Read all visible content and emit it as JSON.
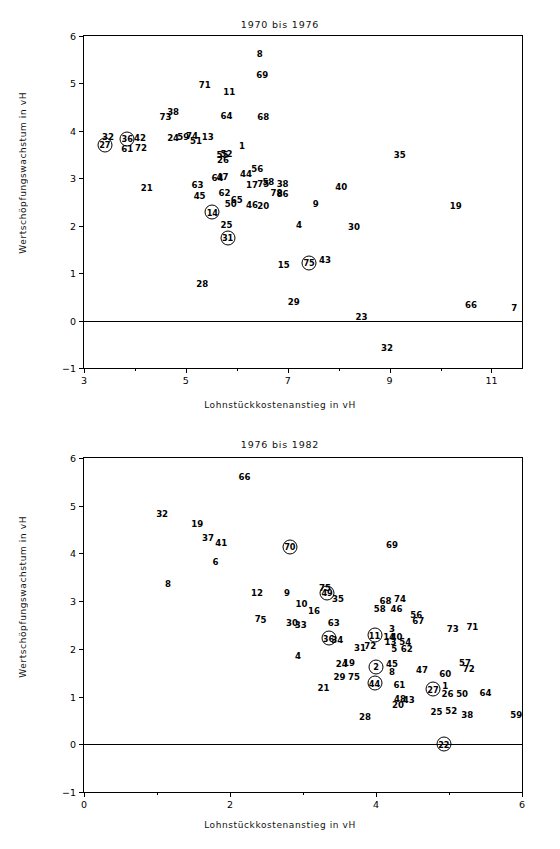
{
  "chart_data": [
    {
      "type": "scatter",
      "title": "1970 bis 1976",
      "xlabel": "Lohnstückkostenanstieg in vH",
      "ylabel": "Wertschöpfungswachstum in vH",
      "xlim": [
        3,
        11.6
      ],
      "ylim": [
        -1,
        6
      ],
      "xticks": [
        3,
        5,
        7,
        9,
        11
      ],
      "xticks_minor": [
        4,
        6,
        8,
        10
      ],
      "yticks": [
        -1,
        0,
        1,
        2,
        3,
        4,
        5,
        6
      ],
      "grid": false,
      "legend": "none",
      "zero_line": 0,
      "note": "Points are drawn as numeric sector labels; circled labels mark highlighted sectors.",
      "points": [
        {
          "label": "8",
          "x": 6.45,
          "y": 5.62,
          "circled": false
        },
        {
          "label": "69",
          "x": 6.5,
          "y": 5.18,
          "circled": false
        },
        {
          "label": "71",
          "x": 5.37,
          "y": 4.97,
          "circled": false
        },
        {
          "label": "11",
          "x": 5.85,
          "y": 4.82,
          "circled": false
        },
        {
          "label": "38",
          "x": 4.75,
          "y": 4.4,
          "circled": false
        },
        {
          "label": "73",
          "x": 4.6,
          "y": 4.3,
          "circled": false
        },
        {
          "label": "64",
          "x": 5.8,
          "y": 4.32,
          "circled": false
        },
        {
          "label": "68",
          "x": 6.52,
          "y": 4.3,
          "circled": false
        },
        {
          "label": "32",
          "x": 3.47,
          "y": 3.88,
          "circled": false
        },
        {
          "label": "27",
          "x": 3.41,
          "y": 3.7,
          "circled": true
        },
        {
          "label": "36",
          "x": 3.85,
          "y": 3.83,
          "circled": true
        },
        {
          "label": "61",
          "x": 3.85,
          "y": 3.62,
          "circled": false
        },
        {
          "label": "42",
          "x": 4.1,
          "y": 3.85,
          "circled": false
        },
        {
          "label": "72",
          "x": 4.12,
          "y": 3.63,
          "circled": false
        },
        {
          "label": "24",
          "x": 4.75,
          "y": 3.84,
          "circled": false
        },
        {
          "label": "59",
          "x": 4.95,
          "y": 3.87,
          "circled": false
        },
        {
          "label": "74",
          "x": 5.12,
          "y": 3.9,
          "circled": false
        },
        {
          "label": "51",
          "x": 5.2,
          "y": 3.78,
          "circled": false
        },
        {
          "label": "13",
          "x": 5.43,
          "y": 3.88,
          "circled": false
        },
        {
          "label": "1",
          "x": 6.1,
          "y": 3.68,
          "circled": false
        },
        {
          "label": "35",
          "x": 9.2,
          "y": 3.5,
          "circled": false
        },
        {
          "label": "52",
          "x": 5.8,
          "y": 3.52,
          "circled": false
        },
        {
          "label": "55",
          "x": 5.72,
          "y": 3.5,
          "circled": false
        },
        {
          "label": "26",
          "x": 5.73,
          "y": 3.38,
          "circled": false
        },
        {
          "label": "56",
          "x": 6.4,
          "y": 3.2,
          "circled": false
        },
        {
          "label": "44",
          "x": 6.18,
          "y": 3.1,
          "circled": false
        },
        {
          "label": "47",
          "x": 5.72,
          "y": 3.02,
          "circled": false
        },
        {
          "label": "64b",
          "x": 5.62,
          "y": 3.0,
          "circled": false
        },
        {
          "label": "63",
          "x": 5.23,
          "y": 2.86,
          "circled": false
        },
        {
          "label": "58",
          "x": 6.62,
          "y": 2.92,
          "circled": false
        },
        {
          "label": "38b",
          "x": 6.9,
          "y": 2.88,
          "circled": false
        },
        {
          "label": "17",
          "x": 6.3,
          "y": 2.85,
          "circled": false
        },
        {
          "label": "75",
          "x": 6.52,
          "y": 2.88,
          "circled": false
        },
        {
          "label": "21",
          "x": 4.23,
          "y": 2.8,
          "circled": false
        },
        {
          "label": "40",
          "x": 8.05,
          "y": 2.82,
          "circled": false
        },
        {
          "label": "78",
          "x": 6.78,
          "y": 2.68,
          "circled": false
        },
        {
          "label": "86",
          "x": 6.9,
          "y": 2.67,
          "circled": false
        },
        {
          "label": "45",
          "x": 5.27,
          "y": 2.62,
          "circled": false
        },
        {
          "label": "62",
          "x": 5.76,
          "y": 2.7,
          "circled": false
        },
        {
          "label": "65",
          "x": 6.0,
          "y": 2.55,
          "circled": false
        },
        {
          "label": "50",
          "x": 5.88,
          "y": 2.45,
          "circled": false
        },
        {
          "label": "46",
          "x": 6.3,
          "y": 2.44,
          "circled": false
        },
        {
          "label": "20",
          "x": 6.52,
          "y": 2.42,
          "circled": false
        },
        {
          "label": "9",
          "x": 7.55,
          "y": 2.45,
          "circled": false
        },
        {
          "label": "19",
          "x": 10.3,
          "y": 2.42,
          "circled": false
        },
        {
          "label": "14",
          "x": 5.52,
          "y": 2.28,
          "circled": true
        },
        {
          "label": "25",
          "x": 5.8,
          "y": 2.02,
          "circled": false
        },
        {
          "label": "4",
          "x": 7.22,
          "y": 2.02,
          "circled": false
        },
        {
          "label": "30",
          "x": 8.3,
          "y": 1.98,
          "circled": false
        },
        {
          "label": "31",
          "x": 5.82,
          "y": 1.75,
          "circled": true
        },
        {
          "label": "75b",
          "x": 7.42,
          "y": 1.22,
          "circled": true
        },
        {
          "label": "43",
          "x": 7.73,
          "y": 1.28,
          "circled": false
        },
        {
          "label": "15",
          "x": 6.92,
          "y": 1.18,
          "circled": false
        },
        {
          "label": "28",
          "x": 5.32,
          "y": 0.78,
          "circled": false
        },
        {
          "label": "29",
          "x": 7.12,
          "y": 0.4,
          "circled": false
        },
        {
          "label": "66",
          "x": 10.6,
          "y": 0.32,
          "circled": false
        },
        {
          "label": "7",
          "x": 11.45,
          "y": 0.26,
          "circled": false
        },
        {
          "label": "23",
          "x": 8.45,
          "y": 0.07,
          "circled": false
        },
        {
          "label": "32b",
          "x": 8.95,
          "y": -0.58,
          "circled": false
        }
      ]
    },
    {
      "type": "scatter",
      "title": "1976 bis 1982",
      "xlabel": "Lohnstückkostenanstieg in vH",
      "ylabel": "Wertschöpfungswachstum in vH",
      "xlim": [
        0,
        6
      ],
      "ylim": [
        -1,
        6
      ],
      "xticks": [
        0,
        2,
        4,
        6
      ],
      "xticks_minor": [
        1,
        3,
        5
      ],
      "yticks": [
        -1,
        0,
        1,
        2,
        3,
        4,
        5,
        6
      ],
      "grid": false,
      "legend": "none",
      "zero_line": 0,
      "points": [
        {
          "label": "66",
          "x": 2.2,
          "y": 5.6,
          "circled": false
        },
        {
          "label": "32",
          "x": 1.07,
          "y": 4.82,
          "circled": false
        },
        {
          "label": "19",
          "x": 1.55,
          "y": 4.62,
          "circled": false
        },
        {
          "label": "37",
          "x": 1.7,
          "y": 4.32,
          "circled": false
        },
        {
          "label": "41",
          "x": 1.88,
          "y": 4.22,
          "circled": false
        },
        {
          "label": "70",
          "x": 2.82,
          "y": 4.14,
          "circled": true
        },
        {
          "label": "69",
          "x": 4.22,
          "y": 4.18,
          "circled": false
        },
        {
          "label": "6",
          "x": 1.8,
          "y": 3.82,
          "circled": false
        },
        {
          "label": "8",
          "x": 1.15,
          "y": 3.35,
          "circled": false
        },
        {
          "label": "12",
          "x": 2.37,
          "y": 3.17,
          "circled": false
        },
        {
          "label": "9",
          "x": 2.78,
          "y": 3.17,
          "circled": false
        },
        {
          "label": "49",
          "x": 3.33,
          "y": 3.18,
          "circled": true
        },
        {
          "label": "75",
          "x": 3.3,
          "y": 3.28,
          "circled": false
        },
        {
          "label": "35",
          "x": 3.48,
          "y": 3.05,
          "circled": false
        },
        {
          "label": "68",
          "x": 4.13,
          "y": 3.0,
          "circled": false
        },
        {
          "label": "74",
          "x": 4.33,
          "y": 3.05,
          "circled": false
        },
        {
          "label": "10",
          "x": 2.98,
          "y": 2.93,
          "circled": false
        },
        {
          "label": "58",
          "x": 4.05,
          "y": 2.84,
          "circled": false
        },
        {
          "label": "46",
          "x": 4.28,
          "y": 2.84,
          "circled": false
        },
        {
          "label": "16",
          "x": 3.15,
          "y": 2.8,
          "circled": false
        },
        {
          "label": "56",
          "x": 4.55,
          "y": 2.7,
          "circled": false
        },
        {
          "label": "67",
          "x": 4.58,
          "y": 2.58,
          "circled": false
        },
        {
          "label": "7",
          "x": 2.38,
          "y": 2.62,
          "circled": false
        },
        {
          "label": "5",
          "x": 2.46,
          "y": 2.6,
          "circled": false
        },
        {
          "label": "30",
          "x": 2.85,
          "y": 2.55,
          "circled": false
        },
        {
          "label": "33",
          "x": 2.97,
          "y": 2.5,
          "circled": false
        },
        {
          "label": "63",
          "x": 3.42,
          "y": 2.55,
          "circled": false
        },
        {
          "label": "73",
          "x": 5.05,
          "y": 2.42,
          "circled": false
        },
        {
          "label": "71",
          "x": 5.32,
          "y": 2.45,
          "circled": false
        },
        {
          "label": "3",
          "x": 4.22,
          "y": 2.42,
          "circled": false
        },
        {
          "label": "36",
          "x": 3.35,
          "y": 2.22,
          "circled": true
        },
        {
          "label": "34",
          "x": 3.47,
          "y": 2.18,
          "circled": false
        },
        {
          "label": "11",
          "x": 3.98,
          "y": 2.28,
          "circled": true
        },
        {
          "label": "14",
          "x": 4.18,
          "y": 2.25,
          "circled": false
        },
        {
          "label": "40",
          "x": 4.28,
          "y": 2.25,
          "circled": false
        },
        {
          "label": "13",
          "x": 4.2,
          "y": 2.15,
          "circled": false
        },
        {
          "label": "54",
          "x": 4.4,
          "y": 2.15,
          "circled": false
        },
        {
          "label": "31",
          "x": 3.78,
          "y": 2.02,
          "circled": false
        },
        {
          "label": "72",
          "x": 3.92,
          "y": 2.05,
          "circled": false
        },
        {
          "label": "5b",
          "x": 4.25,
          "y": 2.0,
          "circled": false
        },
        {
          "label": "62",
          "x": 4.42,
          "y": 2.0,
          "circled": false
        },
        {
          "label": "4",
          "x": 2.93,
          "y": 1.85,
          "circled": false
        },
        {
          "label": "24",
          "x": 3.53,
          "y": 1.68,
          "circled": false
        },
        {
          "label": "19b",
          "x": 3.63,
          "y": 1.7,
          "circled": false
        },
        {
          "label": "2",
          "x": 4.0,
          "y": 1.62,
          "circled": true
        },
        {
          "label": "45",
          "x": 4.22,
          "y": 1.68,
          "circled": false
        },
        {
          "label": "8b",
          "x": 4.22,
          "y": 1.52,
          "circled": false
        },
        {
          "label": "47",
          "x": 4.63,
          "y": 1.55,
          "circled": false
        },
        {
          "label": "57",
          "x": 5.22,
          "y": 1.7,
          "circled": false
        },
        {
          "label": "72b",
          "x": 5.27,
          "y": 1.58,
          "circled": false
        },
        {
          "label": "60",
          "x": 4.95,
          "y": 1.48,
          "circled": false
        },
        {
          "label": "29",
          "x": 3.5,
          "y": 1.42,
          "circled": false
        },
        {
          "label": "75b",
          "x": 3.7,
          "y": 1.42,
          "circled": false
        },
        {
          "label": "44",
          "x": 3.98,
          "y": 1.28,
          "circled": true
        },
        {
          "label": "61",
          "x": 4.32,
          "y": 1.25,
          "circled": false
        },
        {
          "label": "27",
          "x": 4.78,
          "y": 1.15,
          "circled": true
        },
        {
          "label": "1",
          "x": 4.95,
          "y": 1.22,
          "circled": false
        },
        {
          "label": "21",
          "x": 3.28,
          "y": 1.18,
          "circled": false
        },
        {
          "label": "26",
          "x": 4.98,
          "y": 1.05,
          "circled": false
        },
        {
          "label": "50",
          "x": 5.18,
          "y": 1.05,
          "circled": false
        },
        {
          "label": "64",
          "x": 5.5,
          "y": 1.08,
          "circled": false
        },
        {
          "label": "48",
          "x": 4.33,
          "y": 0.95,
          "circled": false
        },
        {
          "label": "43",
          "x": 4.45,
          "y": 0.93,
          "circled": false
        },
        {
          "label": "20",
          "x": 4.3,
          "y": 0.83,
          "circled": false
        },
        {
          "label": "25",
          "x": 4.83,
          "y": 0.68,
          "circled": false
        },
        {
          "label": "52",
          "x": 5.03,
          "y": 0.7,
          "circled": false
        },
        {
          "label": "38",
          "x": 5.25,
          "y": 0.62,
          "circled": false
        },
        {
          "label": "59",
          "x": 5.92,
          "y": 0.62,
          "circled": false
        },
        {
          "label": "28",
          "x": 3.85,
          "y": 0.58,
          "circled": false
        },
        {
          "label": "22",
          "x": 4.93,
          "y": 0.0,
          "circled": true
        }
      ]
    }
  ],
  "figures": [
    {
      "name": "top",
      "title": "1970 bis 1976",
      "xlabel": "Lohnstückkostenanstieg in vH",
      "ylabel": "Wertschöpfungswachstum in vH"
    },
    {
      "name": "bottom",
      "title": "1976 bis 1982",
      "xlabel": "Lohnstückkostenanstieg in vH",
      "ylabel": "Wertschöpfungswachstum in vH"
    }
  ]
}
